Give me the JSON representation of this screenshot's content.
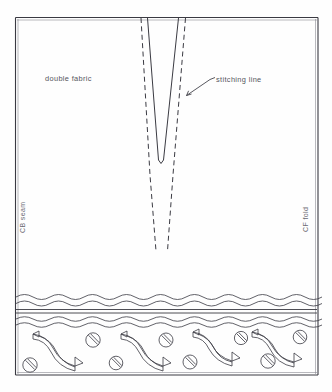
{
  "diagram": {
    "type": "sewing-pattern",
    "canvas": {
      "width": 332,
      "height": 392
    },
    "ink_color": "#3a3a42",
    "label_color": "#55555d",
    "background_color": "#fefefe",
    "labels": {
      "double_fabric": "double fabric",
      "stitching_line": "stitching line",
      "cb_seam": "CB seam",
      "cf_fold": "CF fold"
    },
    "frame": {
      "top_left": [
        15,
        17
      ],
      "top_right": [
        318,
        17
      ],
      "bottom_right": [
        318,
        375
      ],
      "bottom_left": [
        15,
        375
      ]
    },
    "dart": {
      "description": "V-shaped dart with solid stitching legs meeting at apex",
      "left_leg_top": [
        147,
        18
      ],
      "right_leg_top": [
        178,
        18
      ],
      "apex": [
        161,
        163
      ],
      "stitch_left_top": [
        141,
        18
      ],
      "stitch_right_top": [
        185,
        18
      ],
      "stitch_left_bottom": [
        156,
        250
      ],
      "stitch_right_bottom": [
        168,
        250
      ]
    },
    "leader": {
      "label_anchor": [
        212,
        80
      ],
      "arrow_tip": [
        186,
        96
      ]
    },
    "trim_band": {
      "upper_wave_y": 296,
      "rule_y": 310,
      "lower_wave_y": 320,
      "bottom_y": 375,
      "wave_amplitude": 4,
      "wave_period": 34
    },
    "motifs": {
      "ribbon_count": 4,
      "ribbon_x_positions": [
        30,
        118,
        190,
        250
      ],
      "disc_count": 8,
      "disc_radius": 7
    }
  }
}
